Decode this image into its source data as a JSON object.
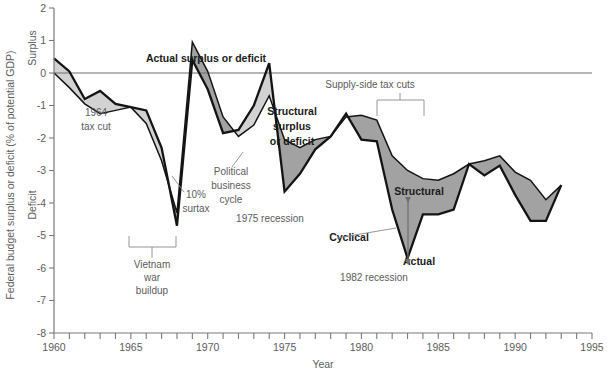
{
  "chart_data": {
    "type": "line",
    "title": "",
    "xlabel": "Year",
    "ylabel": "Federal budget surplus or deficit (% of potential GDP)",
    "ylabel_top": "Surplus",
    "ylabel_bottom": "Deficit",
    "xlim": [
      1960,
      1995
    ],
    "ylim": [
      -8,
      2
    ],
    "grid": false,
    "legend": "inline-annotations",
    "y_ticks": [
      2,
      1,
      0,
      -1,
      -2,
      -3,
      -4,
      -5,
      -6,
      -7,
      -8
    ],
    "y_tick_labels": [
      "2",
      "1",
      "0",
      "-1",
      "-2",
      "-3",
      "-4",
      "-5",
      "-6",
      "-7",
      "-8"
    ],
    "x_ticks": [
      1960,
      1961,
      1962,
      1963,
      1964,
      1965,
      1966,
      1967,
      1968,
      1969,
      1970,
      1971,
      1972,
      1973,
      1974,
      1975,
      1976,
      1977,
      1978,
      1979,
      1980,
      1981,
      1982,
      1983,
      1984,
      1985,
      1986,
      1987,
      1988,
      1989,
      1990,
      1991,
      1992,
      1993,
      1994,
      1995
    ],
    "x_tick_labels": [
      {
        "value": 1960,
        "label": "1960"
      },
      {
        "value": 1965,
        "label": "1965"
      },
      {
        "value": 1970,
        "label": "1970"
      },
      {
        "value": 1975,
        "label": "1975"
      },
      {
        "value": 1980,
        "label": "1980"
      },
      {
        "value": 1985,
        "label": "1985"
      },
      {
        "value": 1990,
        "label": "1990"
      },
      {
        "value": 1995,
        "label": "1995"
      }
    ],
    "x": [
      1960,
      1961,
      1962,
      1963,
      1964,
      1965,
      1966,
      1967,
      1968,
      1969,
      1970,
      1971,
      1972,
      1973,
      1974,
      1975,
      1976,
      1977,
      1978,
      1979,
      1980,
      1981,
      1982,
      1983,
      1984,
      1985,
      1986,
      1987,
      1988,
      1989,
      1990,
      1991,
      1992,
      1993
    ],
    "series": [
      {
        "name": "Actual surplus or deficit",
        "style": "thick-dark-line",
        "values": [
          0.45,
          0.05,
          -0.8,
          -0.55,
          -0.95,
          -1.05,
          -1.15,
          -2.3,
          -4.7,
          0.4,
          -0.5,
          -1.85,
          -1.75,
          -1.0,
          0.3,
          -3.65,
          -3.1,
          -2.35,
          -1.95,
          -1.25,
          -2.05,
          -2.1,
          -4.2,
          -5.7,
          -4.35,
          -4.35,
          -4.2,
          -2.8,
          -3.15,
          -2.85,
          -3.75,
          -4.55,
          -4.55,
          -3.45
        ]
      },
      {
        "name": "Structural surplus or deficit",
        "style": "thin-dark-line",
        "values": [
          0.0,
          -0.45,
          -0.95,
          -1.25,
          -1.15,
          -1.05,
          -1.55,
          -2.7,
          -4.3,
          0.95,
          0.05,
          -1.35,
          -1.95,
          -1.6,
          -0.7,
          -2.05,
          -2.3,
          -2.05,
          -1.95,
          -1.35,
          -1.3,
          -1.45,
          -2.55,
          -3.0,
          -3.25,
          -3.3,
          -3.1,
          -2.8,
          -2.7,
          -2.55,
          -3.05,
          -3.3,
          -3.9,
          -3.45
        ]
      }
    ],
    "annotations": [
      {
        "id": "actual-label",
        "text": "Actual surplus or deficit",
        "bold": true,
        "x": 206,
        "y": 62
      },
      {
        "id": "structural-label-1",
        "text": "Structural",
        "bold": true,
        "x": 292,
        "y": 115
      },
      {
        "id": "structural-label-2",
        "text": "surplus",
        "bold": true,
        "x": 292,
        "y": 130
      },
      {
        "id": "structural-label-3",
        "text": "or deficit",
        "bold": true,
        "x": 292,
        "y": 145
      },
      {
        "id": "tax-cut-1964-line1",
        "text": "1964",
        "x": 96,
        "y": 116
      },
      {
        "id": "tax-cut-1964-line2",
        "text": "tax cut",
        "x": 96,
        "y": 130
      },
      {
        "id": "surtax-line1",
        "text": "10%",
        "x": 196,
        "y": 198
      },
      {
        "id": "surtax-line2",
        "text": "surtax",
        "x": 196,
        "y": 212
      },
      {
        "id": "political-cycle-line1",
        "text": "Political",
        "x": 231,
        "y": 175
      },
      {
        "id": "political-cycle-line2",
        "text": "business",
        "x": 231,
        "y": 189
      },
      {
        "id": "political-cycle-line3",
        "text": "cycle",
        "x": 231,
        "y": 203
      },
      {
        "id": "recession-1975",
        "text": "1975 recession",
        "x": 270,
        "y": 222
      },
      {
        "id": "vietnam-line1",
        "text": "Vietnam",
        "x": 152,
        "y": 268
      },
      {
        "id": "vietnam-line2",
        "text": "war",
        "x": 152,
        "y": 281
      },
      {
        "id": "vietnam-line3",
        "text": "buildup",
        "x": 152,
        "y": 294
      },
      {
        "id": "supply-side-tax-cuts",
        "text": "Supply-side tax cuts",
        "x": 370,
        "y": 88
      },
      {
        "id": "structural-arrow-label",
        "text": "Structural",
        "bold": true,
        "x": 419,
        "y": 195
      },
      {
        "id": "cyclical-label",
        "text": "Cyclical",
        "bold": true,
        "x": 349,
        "y": 241
      },
      {
        "id": "actual-arrow-label",
        "text": "Actual",
        "bold": true,
        "x": 419,
        "y": 265
      },
      {
        "id": "recession-1982",
        "text": "1982 recession",
        "x": 374,
        "y": 281
      }
    ],
    "colors": {
      "line": "#141414",
      "band_structural_below_actual": "#a2a2a2",
      "band_actual_below_structural": "#d2d2d2",
      "axis": "#7a7a7d",
      "text": "#5c5c5e"
    }
  }
}
